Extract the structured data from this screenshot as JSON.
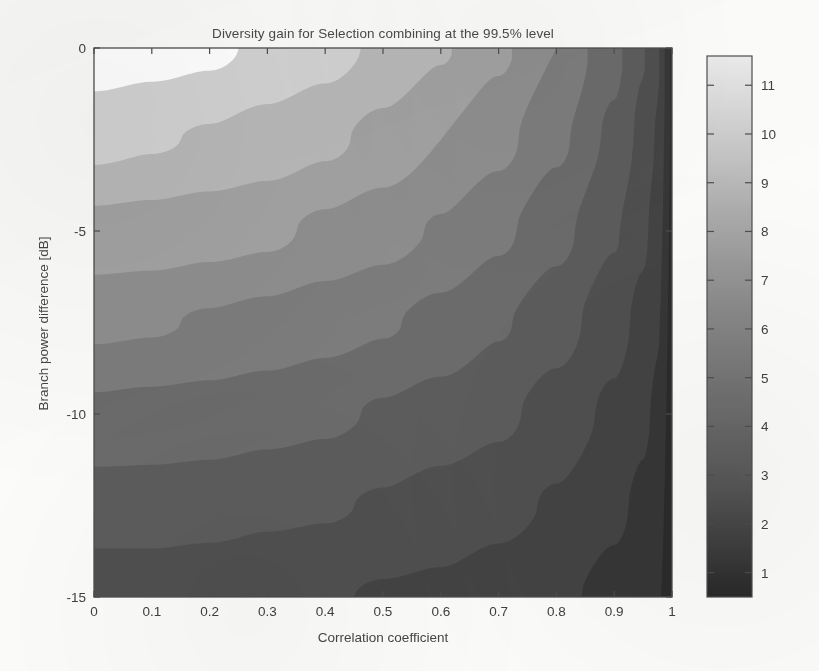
{
  "figure": {
    "background": "#fbfbfa",
    "width": 819,
    "height": 671
  },
  "chart_data": {
    "type": "heatmap",
    "subtype": "filled-contour",
    "title": "Diversity gain for Selection combining at the 99.5% level",
    "xlabel": "Correlation coefficient",
    "ylabel": "Branch power difference [dB]",
    "xlim": [
      0,
      1
    ],
    "ylim": [
      -15,
      0
    ],
    "xticks": [
      0,
      0.1,
      0.2,
      0.3,
      0.4,
      0.5,
      0.6,
      0.7,
      0.8,
      0.9,
      1
    ],
    "xticklabels": [
      "0",
      "0.1",
      "0.2",
      "0.3",
      "0.4",
      "0.5",
      "0.6",
      "0.7",
      "0.8",
      "0.9",
      "1"
    ],
    "yticks": [
      0,
      -5,
      -10,
      -15
    ],
    "yticklabels": [
      "0",
      "-5",
      "-10",
      "-15"
    ],
    "grid": false,
    "legend": "colorbar-right",
    "colormap": "gray",
    "zlabel": "Diversity gain [dB]",
    "zlim": [
      0.5,
      11.6
    ],
    "contour_levels": [
      1,
      2,
      3,
      4,
      5,
      6,
      7,
      8,
      9,
      10,
      11
    ],
    "band_colors": [
      "#2b2b2b",
      "#363636",
      "#434343",
      "#4f4f4f",
      "#5c5c5c",
      "#6b6b6b",
      "#7c7c7c",
      "#8e8e8e",
      "#a2a2a2",
      "#b8b8b8",
      "#d2d2d2",
      "#ffffff"
    ],
    "grid_x": [
      0,
      0.1,
      0.2,
      0.3,
      0.4,
      0.5,
      0.6,
      0.7,
      0.8,
      0.9,
      0.95,
      0.975,
      1
    ],
    "grid_y": [
      0,
      -2.5,
      -5,
      -7.5,
      -10,
      -12.5,
      -15
    ],
    "values": [
      [
        11.6,
        11.4,
        11.2,
        10.8,
        10.4,
        9.8,
        9.1,
        8.2,
        7.0,
        5.3,
        4.1,
        3.2,
        1.0
      ],
      [
        10.3,
        10.1,
        9.9,
        9.6,
        9.2,
        8.7,
        8.0,
        7.3,
        6.2,
        4.8,
        3.7,
        2.9,
        0.9
      ],
      [
        8.7,
        8.6,
        8.4,
        8.2,
        7.8,
        7.4,
        6.9,
        6.2,
        5.3,
        4.1,
        3.2,
        2.5,
        0.8
      ],
      [
        7.2,
        7.1,
        6.9,
        6.7,
        6.4,
        6.1,
        5.7,
        5.1,
        4.4,
        3.4,
        2.7,
        2.1,
        0.7
      ],
      [
        5.8,
        5.7,
        5.6,
        5.4,
        5.2,
        4.9,
        4.6,
        4.2,
        3.6,
        2.8,
        2.2,
        1.8,
        0.6
      ],
      [
        4.5,
        4.5,
        4.4,
        4.2,
        4.1,
        3.9,
        3.6,
        3.3,
        2.9,
        2.2,
        1.8,
        1.4,
        0.5
      ],
      [
        3.4,
        3.4,
        3.3,
        3.2,
        3.1,
        2.9,
        2.8,
        2.5,
        2.2,
        1.7,
        1.4,
        1.1,
        0.4
      ]
    ]
  },
  "colorbar": {
    "ticks": [
      1,
      2,
      3,
      4,
      5,
      6,
      7,
      8,
      9,
      10,
      11
    ],
    "ticklabels": [
      "1",
      "2",
      "3",
      "4",
      "5",
      "6",
      "7",
      "8",
      "9",
      "10",
      "11"
    ],
    "min": 0.5,
    "max": 11.6,
    "top_color": "#e9e9e9",
    "bottom_color": "#272727"
  },
  "axes": {
    "frame_color": "#4d4d4d",
    "tick_color": "#4d4d4d"
  }
}
